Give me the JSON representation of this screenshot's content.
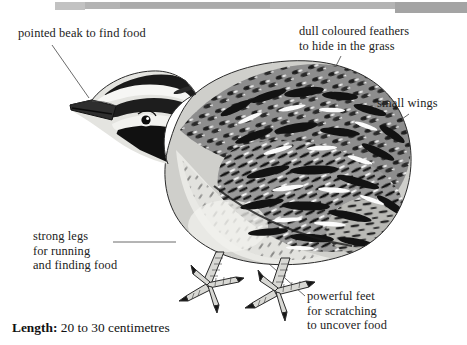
{
  "document": {
    "title": "Quail labelled diagram",
    "subject": "quail",
    "background_color": "#ffffff",
    "ink_color": "#222222"
  },
  "header": {
    "type": "scan-artifact-bar",
    "color": "#b4b4b4",
    "color_dark": "#a4a4a4"
  },
  "labels": [
    {
      "id": "beak",
      "text": "pointed beak to find food",
      "points_to": "beak"
    },
    {
      "id": "feathers",
      "text": "dull coloured feathers\nto hide in the grass",
      "points_to": "back-plumage"
    },
    {
      "id": "wings",
      "text": "small wings",
      "points_to": "wing"
    },
    {
      "id": "legs",
      "text": "strong legs\nfor running\nand finding food",
      "points_to": "leg"
    },
    {
      "id": "feet",
      "text": "powerful feet\nfor scratching\nto uncover food",
      "points_to": "foot"
    }
  ],
  "caption": {
    "key": "Length:",
    "value": " 20 to 30 centimetres"
  },
  "illustration": {
    "name": "quail-illustration",
    "style": "black-and-white engraving",
    "alt": "Side view of a quail standing, facing left, with striped head, speckled barred plumage and scaled feet"
  }
}
